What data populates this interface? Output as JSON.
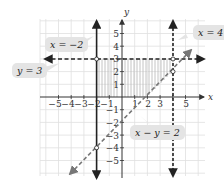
{
  "figure": {
    "axes": {
      "x_label": "x",
      "y_label": "y",
      "x_ticks": [
        "−5",
        "−4",
        "−3",
        "−2",
        "−1",
        "1",
        "2",
        "3",
        "4",
        "5"
      ],
      "y_ticks": [
        "5",
        "4",
        "3",
        "2",
        "1",
        "−1",
        "−2",
        "−3",
        "−4",
        "−5"
      ],
      "range": [
        -6.5,
        6.5
      ]
    },
    "callouts": {
      "x_eq_neg2": "x = −2",
      "y_eq_3": "y = 3",
      "x_eq_4": "x = 4",
      "x_minus_y": "x − y = 2"
    },
    "lines": [
      {
        "equation": "x = −2",
        "style": "solid",
        "boundary_included": true
      },
      {
        "equation": "y = 3",
        "style": "dashed",
        "boundary_included": false
      },
      {
        "equation": "x = 4",
        "style": "dashed",
        "boundary_included": false
      },
      {
        "equation": "x − y = 2",
        "style": "dashed",
        "boundary_included": false
      }
    ],
    "vertices": [
      {
        "point": "(−2, 3)",
        "filled": false
      },
      {
        "point": "(4, 3)",
        "filled": false
      },
      {
        "point": "(4, 2)",
        "filled": false
      },
      {
        "point": "(−2, −4)",
        "filled": false
      }
    ],
    "shaded_region": "−2 ≤ x < 4, y < 3, x − y > 2 (region above 0 shown with vertical hatch from x=−2 to x=4, y between 0 and 3)",
    "colors": {
      "grid": "#dddddd",
      "axis": "#333333",
      "solid_line": "#222222",
      "dashed_line": "#222222",
      "diagonal_line": "#777777",
      "shade": "#bbbbbb",
      "callout_bg": "#e4e4e4"
    }
  }
}
